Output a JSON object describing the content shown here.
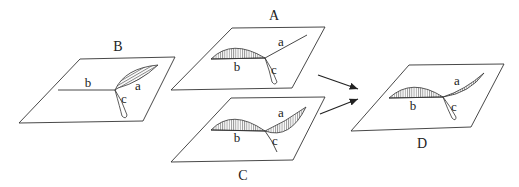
{
  "diagram": {
    "panels": [
      {
        "id": "B",
        "label": "B",
        "branches": [
          "a",
          "b",
          "c"
        ]
      },
      {
        "id": "A",
        "label": "A",
        "branches": [
          "a",
          "b",
          "c"
        ]
      },
      {
        "id": "C",
        "label": "C",
        "branches": [
          "a",
          "b",
          "c"
        ]
      },
      {
        "id": "D",
        "label": "D",
        "branches": [
          "a",
          "b",
          "c"
        ]
      }
    ],
    "arrows": [
      {
        "from": "A",
        "to": "D"
      },
      {
        "from": "C",
        "to": "D"
      }
    ],
    "colors": {
      "stroke": "#333333",
      "background": "#ffffff"
    }
  }
}
